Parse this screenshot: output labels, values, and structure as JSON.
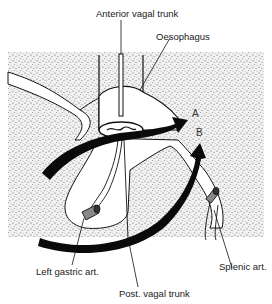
{
  "figure": {
    "type": "anatomical-diagram",
    "labels": {
      "anterior_vagal_trunk": "Anterior vagal trunk",
      "oesophagus": "Oesophagus",
      "arrow_a": "A",
      "arrow_b": "B",
      "left_gastric_art": "Left gastric art.",
      "splenic_art": "Splenic art.",
      "post_vagal_trunk": "Post. vagal trunk"
    },
    "colors": {
      "background": "#ffffff",
      "stipple": "#d9d9d9",
      "ink": "#111111",
      "organ_fill": "#ffffff"
    }
  }
}
